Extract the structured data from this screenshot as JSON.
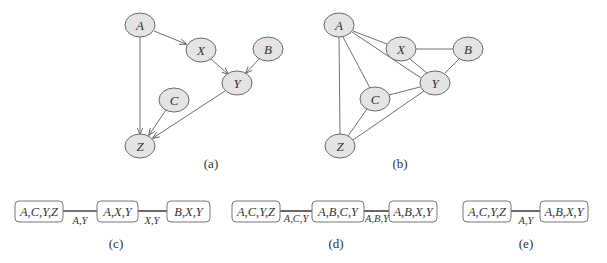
{
  "figure": {
    "graph_a": {
      "caption": "(a)",
      "type": "directed",
      "nodes": [
        {
          "id": "A",
          "label": "A",
          "x": 140,
          "y": 25
        },
        {
          "id": "X",
          "label": "X",
          "x": 201,
          "y": 50
        },
        {
          "id": "B",
          "label": "B",
          "x": 268,
          "y": 49
        },
        {
          "id": "Y",
          "label": "Y",
          "x": 237,
          "y": 83
        },
        {
          "id": "C",
          "label": "C",
          "x": 174,
          "y": 100
        },
        {
          "id": "Z",
          "label": "Z",
          "x": 140,
          "y": 146
        }
      ],
      "edges": [
        [
          "A",
          "X"
        ],
        [
          "A",
          "Z"
        ],
        [
          "X",
          "Y"
        ],
        [
          "B",
          "Y"
        ],
        [
          "Y",
          "Z"
        ],
        [
          "C",
          "Z"
        ]
      ]
    },
    "graph_b": {
      "caption": "(b)",
      "type": "undirected",
      "nodes": [
        {
          "id": "A",
          "label": "A",
          "x": 339,
          "y": 25
        },
        {
          "id": "X",
          "label": "X",
          "x": 401,
          "y": 49
        },
        {
          "id": "B",
          "label": "B",
          "x": 468,
          "y": 49
        },
        {
          "id": "Y",
          "label": "Y",
          "x": 435,
          "y": 83
        },
        {
          "id": "C",
          "label": "C",
          "x": 375,
          "y": 99
        },
        {
          "id": "Z",
          "label": "Z",
          "x": 340,
          "y": 146
        }
      ],
      "edges": [
        [
          "A",
          "X"
        ],
        [
          "A",
          "Y"
        ],
        [
          "A",
          "C"
        ],
        [
          "A",
          "Z"
        ],
        [
          "X",
          "B"
        ],
        [
          "X",
          "Y"
        ],
        [
          "B",
          "Y"
        ],
        [
          "C",
          "Y"
        ],
        [
          "C",
          "Z"
        ],
        [
          "Z",
          "Y"
        ]
      ]
    },
    "tree_c": {
      "caption": "(c)",
      "cliques": [
        "A,C,Y,Z",
        "A,X,Y",
        "B,X,Y"
      ],
      "separators": [
        "A,Y",
        "X,Y"
      ]
    },
    "tree_d": {
      "caption": "(d)",
      "cliques": [
        "A,C,Y,Z",
        "A,B,C,Y",
        "A,B,X,Y"
      ],
      "separators": [
        "A,C,Y",
        "A,B,Y"
      ]
    },
    "tree_e": {
      "caption": "(e)",
      "cliques": [
        "A,C,Y,Z",
        "A,B,X,Y"
      ],
      "separators": [
        "A,Y"
      ]
    }
  }
}
